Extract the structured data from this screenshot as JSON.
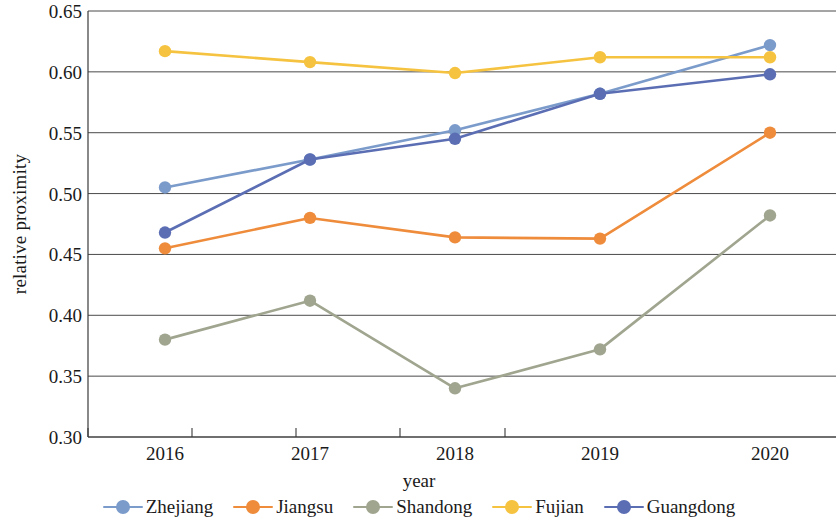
{
  "chart_data": {
    "type": "line",
    "title": "",
    "xlabel": "year",
    "ylabel": "relative proximity",
    "categories": [
      "2016",
      "2017",
      "2018",
      "2019",
      "2020"
    ],
    "x": [
      2016,
      2017,
      2018,
      2019,
      2020
    ],
    "ylim": [
      0.3,
      0.65
    ],
    "yticks": [
      "0.65",
      "0.60",
      "0.55",
      "0.50",
      "0.45",
      "0.40",
      "0.35",
      "0.30"
    ],
    "ytick_values": [
      0.65,
      0.6,
      0.55,
      0.5,
      0.45,
      0.4,
      0.35,
      0.3
    ],
    "grid": true,
    "grid_axis": "y",
    "legend_position": "bottom",
    "series": [
      {
        "name": "Zhejiang",
        "color": "#7B9BCB",
        "values": [
          0.505,
          0.528,
          0.552,
          0.582,
          0.622
        ]
      },
      {
        "name": "Jiangsu",
        "color": "#EE8C3C",
        "values": [
          0.455,
          0.48,
          0.464,
          0.463,
          0.55
        ]
      },
      {
        "name": "Shandong",
        "color": "#9FA58E",
        "values": [
          0.38,
          0.412,
          0.34,
          0.372,
          0.482
        ]
      },
      {
        "name": "Fujian",
        "color": "#F6C340",
        "values": [
          0.617,
          0.608,
          0.599,
          0.612,
          0.612
        ]
      },
      {
        "name": "Guangdong",
        "color": "#5B6EB4",
        "values": [
          0.468,
          0.528,
          0.545,
          0.582,
          0.598
        ]
      }
    ]
  }
}
